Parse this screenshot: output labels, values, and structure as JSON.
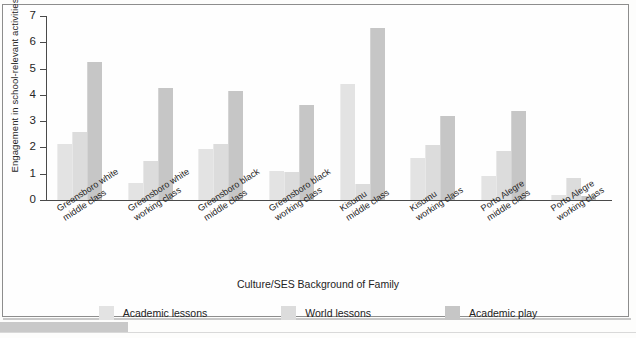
{
  "chart_data": {
    "type": "bar",
    "title": "",
    "xlabel": "Culture/SES Background of Family",
    "ylabel": "Engagement in school-relevant activities",
    "ylim": [
      0,
      7
    ],
    "yticks": [
      0,
      1,
      2,
      3,
      4,
      5,
      6,
      7
    ],
    "grid": false,
    "legend_position": "bottom",
    "categories": [
      "Greensboro white middle class",
      "Greensboro white working class",
      "Greensboro black middle class",
      "Greensboro black working class",
      "Kisumu middle class",
      "Kisumu working class",
      "Porto Alegre middle class",
      "Porto Alegre working class"
    ],
    "category_lines": [
      [
        "Greensboro white",
        "middle class"
      ],
      [
        "Greensboro white",
        "working class"
      ],
      [
        "Greensboro black",
        "middle class"
      ],
      [
        "Greensboro black",
        "working class"
      ],
      [
        "Kisumu",
        "middle class"
      ],
      [
        "Kisumu",
        "working class"
      ],
      [
        "Porto Alegre",
        "middle class"
      ],
      [
        "Porto Alegre",
        "working class"
      ]
    ],
    "series": [
      {
        "name": "Academic lessons",
        "color": "#e3e3e3",
        "values": [
          2.15,
          0.65,
          1.95,
          1.1,
          4.4,
          1.6,
          0.9,
          0.2
        ]
      },
      {
        "name": "World lessons",
        "color": "#dcdcdc",
        "values": [
          2.6,
          1.5,
          2.15,
          1.05,
          0.6,
          2.1,
          1.85,
          0.85
        ]
      },
      {
        "name": "Academic play",
        "color": "#c6c6c6",
        "values": [
          5.25,
          4.25,
          4.15,
          3.6,
          6.55,
          3.2,
          3.4,
          0.15
        ]
      }
    ]
  }
}
